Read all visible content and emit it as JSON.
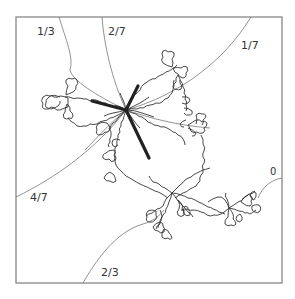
{
  "figure": {
    "type": "julia-set-external-rays",
    "frame": {
      "x": 16,
      "y": 17,
      "width": 266,
      "height": 266,
      "stroke": "#888888"
    },
    "colors": {
      "ray": "#777777",
      "julia": "#333333",
      "spine": "#222222",
      "label": "#333333"
    },
    "ray_labels": [
      {
        "text": "1/3",
        "x": 37,
        "y": 26
      },
      {
        "text": "2/7",
        "x": 108,
        "y": 26
      },
      {
        "text": "1/7",
        "x": 241,
        "y": 40
      },
      {
        "text": "4/7",
        "x": 30,
        "y": 192
      },
      {
        "text": "2/3",
        "x": 101,
        "y": 267
      },
      {
        "text": "0",
        "x": 270,
        "y": 167
      }
    ],
    "branch_points": [
      {
        "name": "alpha",
        "x": 126,
        "y": 110
      },
      {
        "name": "lower",
        "x": 172,
        "y": 193
      },
      {
        "name": "right",
        "x": 229,
        "y": 208
      }
    ],
    "spine_segments": [
      {
        "from": [
          126,
          110
        ],
        "to": [
          92,
          101
        ]
      },
      {
        "from": [
          126,
          110
        ],
        "to": [
          138,
          86
        ]
      },
      {
        "from": [
          126,
          110
        ],
        "to": [
          149,
          158
        ]
      }
    ]
  }
}
